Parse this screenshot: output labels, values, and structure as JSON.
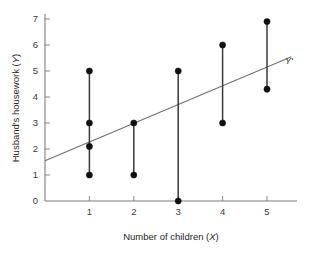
{
  "chart_data": {
    "type": "scatter",
    "title": "",
    "xlabel": "Number of children (X)",
    "xlabel_main": "Number of children (",
    "xlabel_var": "X",
    "xlabel_close": ")",
    "ylabel": "Husband's housework (Y)",
    "ylabel_main": "Husband's housework (",
    "ylabel_var": "Y",
    "ylabel_close": ")",
    "xlim": [
      0,
      5.9
    ],
    "ylim": [
      0,
      7.4
    ],
    "grid": false,
    "legend": "none",
    "xticks": [
      1,
      2,
      3,
      4,
      5
    ],
    "xtick_labels": [
      "1",
      "2",
      "3",
      "4",
      "5"
    ],
    "yticks": [
      0,
      1,
      2,
      3,
      4,
      5,
      6,
      7
    ],
    "ytick_labels": [
      "0",
      "1",
      "2",
      "3",
      "4",
      "5",
      "6",
      "7"
    ],
    "points": [
      {
        "x": 1,
        "y": 5.0
      },
      {
        "x": 1,
        "y": 3.0
      },
      {
        "x": 1,
        "y": 2.1
      },
      {
        "x": 1,
        "y": 1.0
      },
      {
        "x": 2,
        "y": 3.0
      },
      {
        "x": 2,
        "y": 1.0
      },
      {
        "x": 3,
        "y": 5.0
      },
      {
        "x": 3,
        "y": 0.0
      },
      {
        "x": 4,
        "y": 6.0
      },
      {
        "x": 4,
        "y": 3.0
      },
      {
        "x": 5,
        "y": 6.9
      },
      {
        "x": 5,
        "y": 4.3
      }
    ],
    "residual_segments": [
      {
        "x": 1,
        "y_low": 1.0,
        "y_high": 5.0
      },
      {
        "x": 2,
        "y_low": 1.0,
        "y_high": 3.0
      },
      {
        "x": 3,
        "y_low": 0.0,
        "y_high": 5.0
      },
      {
        "x": 4,
        "y_low": 3.0,
        "y_high": 6.0
      },
      {
        "x": 5,
        "y_low": 4.3,
        "y_high": 6.9
      }
    ],
    "regression_line": {
      "label": "Y'",
      "intercept": 1.55,
      "slope": 0.72,
      "x_start": 0.0,
      "x_end": 5.55
    },
    "colors": {
      "point": "#111111",
      "residual": "#3a3a3a",
      "regression": "#6f6f6f",
      "axis": "#7d7d7d",
      "text": "#262626",
      "background": "#ffffff"
    }
  }
}
